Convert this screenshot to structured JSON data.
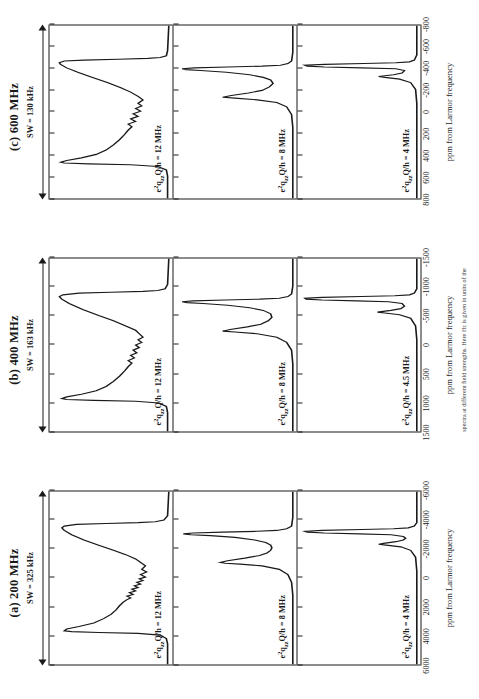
{
  "figure": {
    "axis_title": "ppm from Larmor frequency",
    "caption": "spectra at different field strengths. Here Hz is given in units of the"
  },
  "panels": [
    {
      "title": "(a) 200 MHz",
      "sw_label": "SW = 325 kHz",
      "tick_labels": [
        "6000",
        "4000",
        "2000",
        "0",
        "-2000",
        "-4000",
        "-6000"
      ],
      "axis_title": "ppm from Larmor frequency",
      "subpanels": [
        {
          "cq_prefix": "e",
          "cq_sup": "2",
          "cq_mid": "q",
          "cq_sub": "zz",
          "cq_rest": "Q/h = 12 MHz",
          "cq_text": "e2qzzQ/h = 12 MHz"
        },
        {
          "cq_prefix": "e",
          "cq_sup": "2",
          "cq_mid": "q",
          "cq_sub": "zz",
          "cq_rest": "Q/h = 8 MHz",
          "cq_text": "e2qzzQ/h = 8 MHz"
        },
        {
          "cq_prefix": "e",
          "cq_sup": "2",
          "cq_mid": "q",
          "cq_sub": "zz",
          "cq_rest": "Q/h = 4 MHz",
          "cq_text": "e2qzzQ/h = 4 MHz"
        }
      ]
    },
    {
      "title": "(b) 400 MHz",
      "sw_label": "SW = 163 kHz",
      "tick_labels": [
        "1500",
        "1000",
        "500",
        "0",
        "-500",
        "-1000",
        "-1500"
      ],
      "axis_title": "ppm from Larmor frequency",
      "subpanels": [
        {
          "cq_prefix": "e",
          "cq_sup": "2",
          "cq_mid": "q",
          "cq_sub": "zz",
          "cq_rest": "Q/h = 12 MHz",
          "cq_text": "e2qzzQ/h = 12 MHz"
        },
        {
          "cq_prefix": "e",
          "cq_sup": "2",
          "cq_mid": "q",
          "cq_sub": "zz",
          "cq_rest": "Q/h = 8 MHz",
          "cq_text": "e2qzzQ/h = 8 MHz"
        },
        {
          "cq_prefix": "e",
          "cq_sup": "2",
          "cq_mid": "q",
          "cq_sub": "zz",
          "cq_rest": "Q/h = 4.5 MHz",
          "cq_text": "e2qzzQ/h = 4.5 MHz"
        }
      ]
    },
    {
      "title": "(c) 600 MHz",
      "sw_label": "SW = 130 kHz",
      "tick_labels": [
        "800",
        "600",
        "400",
        "200",
        "0",
        "-200",
        "-400",
        "-600",
        "-800"
      ],
      "axis_title": "ppm from Larmor frequency",
      "subpanels": [
        {
          "cq_prefix": "e",
          "cq_sup": "2",
          "cq_mid": "q",
          "cq_sub": "zz",
          "cq_rest": "Q/h = 12 MHz",
          "cq_text": "e2qzzQ/h = 12 MHz"
        },
        {
          "cq_prefix": "e",
          "cq_sup": "2",
          "cq_mid": "q",
          "cq_sub": "zz",
          "cq_rest": "Q/h = 8 MHz",
          "cq_text": "e2qzzQ/h = 8 MHz"
        },
        {
          "cq_prefix": "e",
          "cq_sup": "2",
          "cq_mid": "q",
          "cq_sub": "zz",
          "cq_rest": "Q/h = 4 MHz",
          "cq_text": "e2qzzQ/h = 4 MHz"
        }
      ]
    }
  ],
  "chart_data": {
    "type": "line",
    "xlabel": "ppm from Larmor frequency",
    "ylabel": "",
    "grid": false,
    "legend": "none",
    "panels": [
      {
        "name": "(a) 200 MHz",
        "sweep_width": "SW = 325 kHz",
        "xlim": [
          6000,
          -6000
        ],
        "xticks": [
          6000,
          4000,
          2000,
          0,
          -2000,
          -4000,
          -6000
        ],
        "series": [
          {
            "name": "e2qzzQ/h = 12 MHz",
            "description": "broad second-order quadrupolar powder pattern, two horns",
            "horn_positions_ppm": [
              2300,
              -2500
            ],
            "pattern_edges_ppm": [
              3200,
              -3300
            ]
          },
          {
            "name": "e2qzzQ/h = 8 MHz",
            "description": "narrower pattern, sharp main horn plus shoulder",
            "horn_positions_ppm": [
              -1000,
              -1900
            ],
            "pattern_edges_ppm": [
              -400,
              -2400
            ]
          },
          {
            "name": "e2qzzQ/h = 4 MHz",
            "description": "narrow near-symmetric peak",
            "horn_positions_ppm": [
              -400,
              -700
            ],
            "pattern_edges_ppm": [
              -150,
              -900
            ]
          }
        ]
      },
      {
        "name": "(b) 400 MHz",
        "sweep_width": "SW = 163 kHz",
        "xlim": [
          1500,
          -1500
        ],
        "xticks": [
          1500,
          1000,
          500,
          0,
          -500,
          -1000,
          -1500
        ],
        "series": [
          {
            "name": "e2qzzQ/h = 12 MHz",
            "description": "broad second-order quadrupolar powder pattern, two horns",
            "horn_positions_ppm": [
              600,
              -640
            ],
            "pattern_edges_ppm": [
              820,
              -830
            ]
          },
          {
            "name": "e2qzzQ/h = 8 MHz",
            "description": "narrower pattern with sharp horn and shoulder",
            "horn_positions_ppm": [
              -240,
              -480
            ],
            "pattern_edges_ppm": [
              -90,
              -600
            ]
          },
          {
            "name": "e2qzzQ/h = 4.5 MHz",
            "description": "narrow near-symmetric peak",
            "horn_positions_ppm": [
              -110,
              -190
            ],
            "pattern_edges_ppm": [
              -40,
              -240
            ]
          }
        ]
      },
      {
        "name": "(c) 600 MHz",
        "sweep_width": "SW = 130 kHz",
        "xlim": [
          800,
          -800
        ],
        "xticks": [
          800,
          600,
          400,
          200,
          0,
          -200,
          -400,
          -600,
          -800
        ],
        "series": [
          {
            "name": "e2qzzQ/h = 12 MHz",
            "description": "broad second-order quadrupolar powder pattern, two horns",
            "horn_positions_ppm": [
              270,
              -290
            ],
            "pattern_edges_ppm": [
              380,
              -380
            ]
          },
          {
            "name": "e2qzzQ/h = 8 MHz",
            "description": "narrower pattern with sharp horn and shoulder",
            "horn_positions_ppm": [
              -110,
              -215
            ],
            "pattern_edges_ppm": [
              -40,
              -270
            ]
          },
          {
            "name": "e2qzzQ/h = 4 MHz",
            "description": "narrow near-symmetric peak",
            "horn_positions_ppm": [
              -45,
              -80
            ],
            "pattern_edges_ppm": [
              -15,
              -100
            ]
          }
        ]
      }
    ]
  }
}
